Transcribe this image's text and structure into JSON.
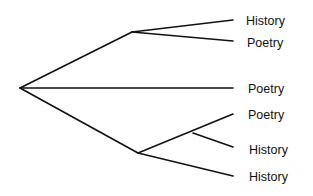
{
  "diagram": {
    "type": "tree",
    "nodes": {
      "root": {
        "x": 20,
        "y": 88
      },
      "upper": {
        "x": 132,
        "y": 32
      },
      "lower": {
        "x": 138,
        "y": 153
      },
      "lower_sub": {
        "x": 193,
        "y": 133
      }
    },
    "edges": [
      {
        "from": "root",
        "to": "upper",
        "x1": 20,
        "y1": 88,
        "x2": 132,
        "y2": 32
      },
      {
        "from": "upper",
        "to": "leaf_1",
        "x1": 132,
        "y1": 32,
        "x2": 233,
        "y2": 20
      },
      {
        "from": "upper",
        "to": "leaf_2",
        "x1": 132,
        "y1": 32,
        "x2": 233,
        "y2": 41
      },
      {
        "from": "root",
        "to": "leaf_3",
        "x1": 20,
        "y1": 88,
        "x2": 233,
        "y2": 88
      },
      {
        "from": "root",
        "to": "lower",
        "x1": 20,
        "y1": 88,
        "x2": 138,
        "y2": 153
      },
      {
        "from": "lower",
        "to": "leaf_4",
        "x1": 138,
        "y1": 153,
        "x2": 233,
        "y2": 114
      },
      {
        "from": "lower_sub",
        "to": "leaf_5",
        "x1": 193,
        "y1": 133,
        "x2": 233,
        "y2": 147
      },
      {
        "from": "lower",
        "to": "leaf_6",
        "x1": 138,
        "y1": 153,
        "x2": 233,
        "y2": 176
      }
    ],
    "leaves": [
      {
        "label": "History",
        "x": 246,
        "y": 25
      },
      {
        "label": "Poetry",
        "x": 247,
        "y": 47
      },
      {
        "label": "Poetry",
        "x": 248,
        "y": 93
      },
      {
        "label": "Poetry",
        "x": 248,
        "y": 119
      },
      {
        "label": "History",
        "x": 249,
        "y": 154
      },
      {
        "label": "History",
        "x": 249,
        "y": 181
      }
    ]
  }
}
